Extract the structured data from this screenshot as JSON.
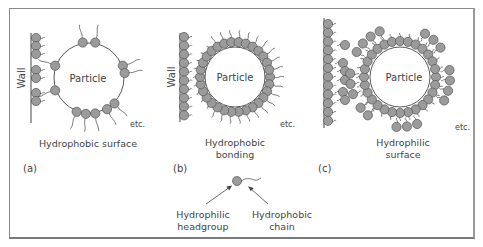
{
  "colors": {
    "head_fill": "#9b9b9b",
    "head_stroke": "#555555",
    "line": "#444444",
    "text": "#444444",
    "frame": "#8a8a8a"
  },
  "legend": {
    "headgroup_label_line1": "Hydrophilic",
    "headgroup_label_line2": "headgroup",
    "chain_label_line1": "Hydrophobic",
    "chain_label_line2": "chain"
  },
  "panels": [
    {
      "id": "a",
      "tag": "(a)",
      "particle_label": "Particle",
      "wall_label": "Wall",
      "etc_label": "etc.",
      "caption_line1": "Hydrophobic surface",
      "caption_line2": "",
      "wall": {
        "x": 31,
        "y1": 33,
        "y2": 123
      },
      "circle": {
        "cx": 89,
        "cy": 78,
        "r": 35
      },
      "mode": "a"
    },
    {
      "id": "b",
      "tag": "(b)",
      "particle_label": "Particle",
      "wall_label": "Wall",
      "etc_label": "etc.",
      "caption_line1": "Hydrophobic",
      "caption_line2": "bonding",
      "wall": {
        "x": 180,
        "y1": 33,
        "y2": 122
      },
      "circle": {
        "cx": 235,
        "cy": 77,
        "r": 30
      },
      "mode": "b"
    },
    {
      "id": "c",
      "tag": "(c)",
      "particle_label": "Particle",
      "wall_label": "",
      "etc_label": "etc.",
      "caption_line1": "Hydrophilic",
      "caption_line2": "surface",
      "wall": {
        "x": 324,
        "y1": 18,
        "y2": 128
      },
      "circle": {
        "cx": 400,
        "cy": 77,
        "r": 30
      },
      "mode": "c"
    }
  ]
}
